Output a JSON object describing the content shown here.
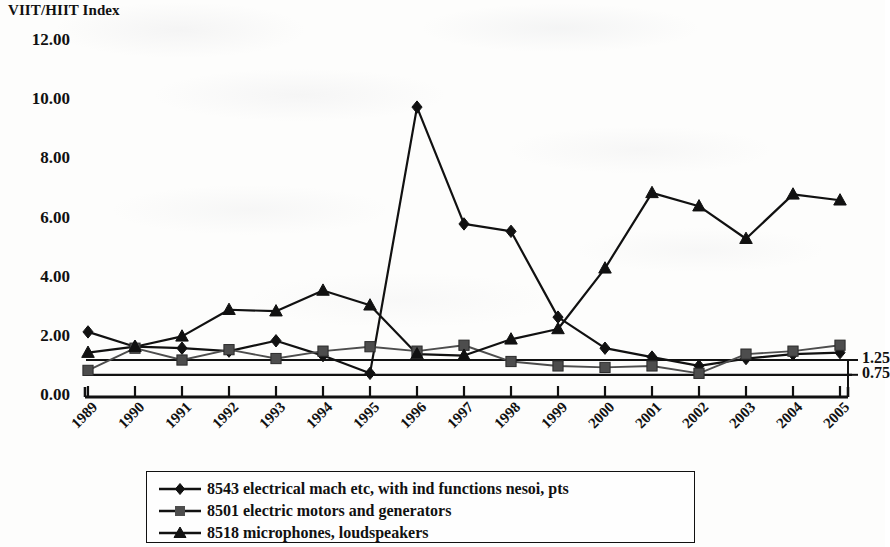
{
  "chart_title": "VIIT/HIIT Index",
  "axes": {
    "y_left_ticks": [
      "12.00",
      "10.00",
      "8.00",
      "6.00",
      "4.00",
      "2.00",
      "0.00"
    ],
    "y_right_ticks": [
      "1.25",
      "0.75"
    ],
    "x_ticks": [
      "1989",
      "1990",
      "1991",
      "1992",
      "1993",
      "1994",
      "1995",
      "1996",
      "1997",
      "1998",
      "1999",
      "2000",
      "2001",
      "2002",
      "2003",
      "2004",
      "2005"
    ]
  },
  "legend": {
    "items": [
      {
        "marker": "diamond-marker",
        "label": "8543 electrical mach etc, with ind functions nesoi, pts"
      },
      {
        "marker": "square-marker",
        "label": "8501 electric motors and generators"
      },
      {
        "marker": "triangle-marker",
        "label": "8518 microphones, loudspeakers"
      }
    ]
  },
  "chart_data": {
    "type": "line",
    "title": "VIIT/HIIT Index",
    "xlabel": "",
    "ylabel": "VIIT/HIIT Index",
    "ylim": [
      0,
      12
    ],
    "ytick_step": 2,
    "grid": false,
    "legend_position": "bottom",
    "x": [
      "1989",
      "1990",
      "1991",
      "1992",
      "1993",
      "1994",
      "1995",
      "1996",
      "1997",
      "1998",
      "1999",
      "2000",
      "2001",
      "2002",
      "2003",
      "2004",
      "2005"
    ],
    "series": [
      {
        "name": "8543 electrical mach etc, with ind functions nesoi, pts",
        "marker": "diamond",
        "color": "#111111",
        "values": [
          2.2,
          1.7,
          1.65,
          1.55,
          1.9,
          1.4,
          0.8,
          9.8,
          5.85,
          5.6,
          2.7,
          1.65,
          1.35,
          1.05,
          1.3,
          1.45,
          1.5
        ]
      },
      {
        "name": "8501 electric motors and generators",
        "marker": "square",
        "color": "#4d4d4d",
        "values": [
          0.9,
          1.65,
          1.25,
          1.6,
          1.3,
          1.55,
          1.7,
          1.55,
          1.75,
          1.2,
          1.05,
          1.0,
          1.05,
          0.8,
          1.45,
          1.55,
          1.75
        ]
      },
      {
        "name": "8518 microphones, loudspeakers",
        "marker": "triangle",
        "color": "#111111",
        "values": [
          1.5,
          1.7,
          2.05,
          2.95,
          2.9,
          3.6,
          3.1,
          1.45,
          1.4,
          1.95,
          2.3,
          4.35,
          6.9,
          6.45,
          5.35,
          6.85,
          6.65
        ]
      }
    ],
    "reference_lines": [
      {
        "label": "1.25",
        "value": 1.25
      },
      {
        "label": "0.75",
        "value": 0.75
      }
    ]
  }
}
